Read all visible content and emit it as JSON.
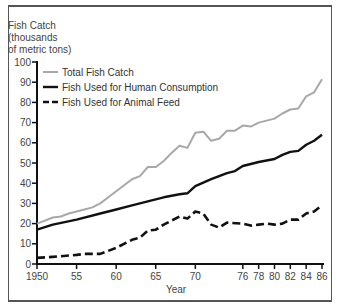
{
  "chart_data": {
    "type": "line",
    "title": "",
    "ylabel": "Fish Catch (thousands of metric tons)",
    "ylabel_lines": [
      "Fish Catch",
      "(thousands",
      "of metric tons)"
    ],
    "xlabel": "Year",
    "ylim": [
      0,
      100
    ],
    "xlim": [
      1950,
      1986
    ],
    "y_ticks": [
      0,
      10,
      20,
      30,
      40,
      50,
      60,
      70,
      80,
      90,
      100
    ],
    "x_ticks": [
      1950,
      1955,
      1960,
      1965,
      1970,
      1976,
      1978,
      1980,
      1982,
      1984,
      1986
    ],
    "x_tick_labels": [
      "1950",
      "55",
      "60",
      "65",
      "70",
      "76",
      "78",
      "80",
      "82",
      "84",
      "86"
    ],
    "grid": false,
    "legend_position": "upper-left",
    "series": [
      {
        "name": "Total Fish Catch",
        "style": "solid",
        "color": "#a8a8a8",
        "x": [
          1950,
          1951,
          1952,
          1953,
          1954,
          1955,
          1956,
          1957,
          1958,
          1959,
          1960,
          1961,
          1962,
          1963,
          1964,
          1965,
          1966,
          1967,
          1968,
          1969,
          1970,
          1971,
          1972,
          1973,
          1974,
          1975,
          1976,
          1977,
          1978,
          1979,
          1980,
          1981,
          1982,
          1983,
          1984,
          1985,
          1986
        ],
        "values": [
          20,
          21.5,
          23,
          23.5,
          25,
          26,
          27,
          28,
          30,
          33,
          36,
          39,
          42,
          43.5,
          48,
          48,
          51,
          55,
          58.5,
          57.5,
          65,
          65.5,
          61,
          62,
          66,
          66,
          68.5,
          68,
          70,
          71,
          72,
          74.5,
          76.5,
          77,
          83,
          85,
          91.5
        ]
      },
      {
        "name": "Fish Used for Human Consumption",
        "style": "solid",
        "color": "#111111",
        "x": [
          1950,
          1952,
          1955,
          1958,
          1960,
          1962,
          1964,
          1966,
          1968,
          1969,
          1970,
          1972,
          1974,
          1975,
          1976,
          1978,
          1980,
          1981,
          1982,
          1983,
          1984,
          1985,
          1986
        ],
        "values": [
          17,
          19.5,
          22,
          25,
          27,
          29,
          31,
          33,
          34.5,
          35,
          38.5,
          42,
          45,
          46,
          48.5,
          50.5,
          52,
          54,
          55.5,
          56,
          59,
          61,
          64
        ]
      },
      {
        "name": "Fish Used for Animal Feed",
        "style": "dashed",
        "color": "#111111",
        "x": [
          1950,
          1952,
          1955,
          1956,
          1958,
          1960,
          1962,
          1963,
          1964,
          1965,
          1966,
          1968,
          1969,
          1970,
          1971,
          1972,
          1973,
          1974,
          1976,
          1977,
          1978,
          1979,
          1980,
          1981,
          1982,
          1983,
          1984,
          1985,
          1986
        ],
        "values": [
          3,
          3.5,
          4.5,
          5,
          5,
          8,
          12,
          13,
          16.5,
          17,
          19.5,
          23.5,
          22.5,
          26,
          25,
          19.5,
          18,
          20.5,
          20,
          19,
          19.5,
          20,
          19.5,
          20,
          22,
          22,
          25,
          26,
          29
        ]
      }
    ]
  }
}
